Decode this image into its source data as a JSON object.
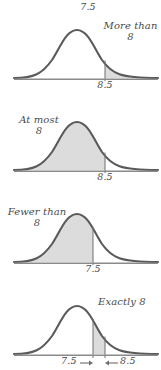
{
  "figure": {
    "type": "statistics-continuity-correction-diagram",
    "top_label": "7.5",
    "curve_color": "#5a5a5a",
    "shade_color": "#dcdcdc",
    "axis_color": "#8a8a8a",
    "text_color": "#4a4a4a",
    "background": "#ffffff"
  },
  "panels": [
    {
      "name": "more-than-8",
      "annotation_line1": "More than",
      "annotation_line2": "8",
      "tick_label": "8.5",
      "region": "right-tail",
      "boundary": 8.5
    },
    {
      "name": "at-most-8",
      "annotation_line1": "At most",
      "annotation_line2": "8",
      "tick_label": "8.5",
      "region": "left-tail",
      "boundary": 8.5
    },
    {
      "name": "fewer-than-8",
      "annotation_line1": "Fewer than",
      "annotation_line2": "8",
      "tick_label": "7.5",
      "region": "left-tail",
      "boundary": 7.5
    },
    {
      "name": "exactly-8",
      "annotation_line1": "Exactly 8",
      "annotation_line2": "",
      "tick_label_left": "7.5",
      "tick_label_right": "8.5",
      "region": "interval",
      "boundary_low": 7.5,
      "boundary_high": 8.5
    }
  ]
}
